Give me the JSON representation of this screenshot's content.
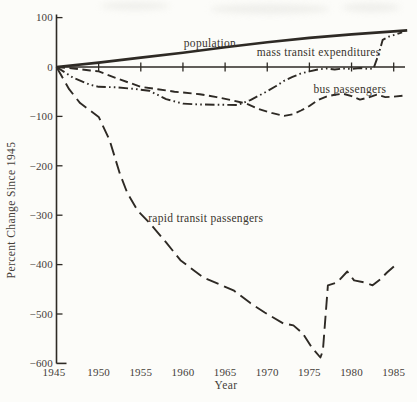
{
  "figure": {
    "background": "#fcfcf9",
    "ink": "#2e2a25",
    "text_color": "#45403a"
  },
  "chart_data": {
    "type": "line",
    "title": "",
    "xlabel": "Year",
    "ylabel": "Percent Change Since 1945",
    "xlim": [
      1945,
      1985
    ],
    "ylim": [
      -600,
      100
    ],
    "x_ticks": [
      1945,
      1950,
      1955,
      1960,
      1965,
      1970,
      1975,
      1980,
      1985
    ],
    "y_ticks": [
      100,
      0,
      -100,
      -200,
      -300,
      -400,
      -500,
      -600
    ],
    "grid": false,
    "legend": "inline-labels",
    "series": [
      {
        "name": "population",
        "label": "population",
        "line_style": "solid",
        "label_pos": [
          1963.2,
          49
        ],
        "points": [
          [
            1945,
            0
          ],
          [
            1950,
            9
          ],
          [
            1955,
            19
          ],
          [
            1960,
            29
          ],
          [
            1965,
            40
          ],
          [
            1970,
            50
          ],
          [
            1975,
            59
          ],
          [
            1980,
            66
          ],
          [
            1985,
            72
          ],
          [
            1986.6,
            74
          ]
        ]
      },
      {
        "name": "mass-transit-expenditures",
        "label": "mass transit expenditures",
        "line_style": "dash-dot-dot",
        "label_pos": [
          1976.1,
          30
        ],
        "points": [
          [
            1945,
            0
          ],
          [
            1947,
            -22
          ],
          [
            1949,
            -36
          ],
          [
            1950,
            -40
          ],
          [
            1952,
            -41
          ],
          [
            1954,
            -44
          ],
          [
            1956,
            -48
          ],
          [
            1958,
            -65
          ],
          [
            1960,
            -74
          ],
          [
            1962,
            -76
          ],
          [
            1966.5,
            -77
          ],
          [
            1968,
            -67
          ],
          [
            1970,
            -49
          ],
          [
            1971,
            -39
          ],
          [
            1972,
            -28
          ],
          [
            1973,
            -20
          ],
          [
            1974,
            -13
          ],
          [
            1975,
            -9
          ],
          [
            1976,
            -5
          ],
          [
            1977,
            -3
          ],
          [
            1978,
            -5
          ],
          [
            1979,
            -3
          ],
          [
            1980,
            -4
          ],
          [
            1981,
            -2
          ],
          [
            1982,
            -4
          ],
          [
            1982.6,
            -3
          ],
          [
            1983.2,
            25
          ],
          [
            1983.7,
            55
          ],
          [
            1984.5,
            62
          ],
          [
            1985.3,
            66
          ],
          [
            1986,
            70
          ]
        ]
      },
      {
        "name": "bus-passengers",
        "label": "bus passengers",
        "line_style": "dashed",
        "label_pos": [
          1979.8,
          -45
        ],
        "points": [
          [
            1945,
            0
          ],
          [
            1947,
            -3
          ],
          [
            1949,
            -7
          ],
          [
            1950,
            -9
          ],
          [
            1952,
            -22
          ],
          [
            1955,
            -40
          ],
          [
            1957,
            -45
          ],
          [
            1959,
            -50
          ],
          [
            1962,
            -55
          ],
          [
            1964,
            -61
          ],
          [
            1966,
            -68
          ],
          [
            1967.5,
            -74
          ],
          [
            1969,
            -85
          ],
          [
            1970.5,
            -93
          ],
          [
            1972,
            -99
          ],
          [
            1973,
            -96
          ],
          [
            1974,
            -88
          ],
          [
            1975,
            -79
          ],
          [
            1976,
            -67
          ],
          [
            1977,
            -60
          ],
          [
            1978,
            -56
          ],
          [
            1979,
            -54
          ],
          [
            1980,
            -59
          ],
          [
            1981,
            -66
          ],
          [
            1982,
            -62
          ],
          [
            1983,
            -56
          ],
          [
            1984,
            -61
          ],
          [
            1985,
            -60
          ],
          [
            1986.2,
            -58
          ]
        ]
      },
      {
        "name": "rapid-transit-passengers",
        "label": "rapid transit passengers",
        "line_style": "long-dash",
        "label_pos": [
          1962.7,
          -307
        ],
        "points": [
          [
            1945,
            0
          ],
          [
            1946.5,
            -45
          ],
          [
            1947.8,
            -73
          ],
          [
            1950,
            -101
          ],
          [
            1951.3,
            -148
          ],
          [
            1952.5,
            -215
          ],
          [
            1953.4,
            -255
          ],
          [
            1954.6,
            -290
          ],
          [
            1956.1,
            -317
          ],
          [
            1958,
            -355
          ],
          [
            1959.7,
            -391
          ],
          [
            1962.4,
            -426
          ],
          [
            1966,
            -452
          ],
          [
            1968,
            -478
          ],
          [
            1969.7,
            -497
          ],
          [
            1971.9,
            -519
          ],
          [
            1973.1,
            -523
          ],
          [
            1974.2,
            -539
          ],
          [
            1975.3,
            -568
          ],
          [
            1976.3,
            -588
          ],
          [
            1976.6,
            -574
          ],
          [
            1977.2,
            -442
          ],
          [
            1978.3,
            -436
          ],
          [
            1979.5,
            -414
          ],
          [
            1980.3,
            -432
          ],
          [
            1981.5,
            -436
          ],
          [
            1982.5,
            -442
          ],
          [
            1983.4,
            -430
          ],
          [
            1984.2,
            -416
          ],
          [
            1985.4,
            -398
          ]
        ]
      }
    ]
  }
}
